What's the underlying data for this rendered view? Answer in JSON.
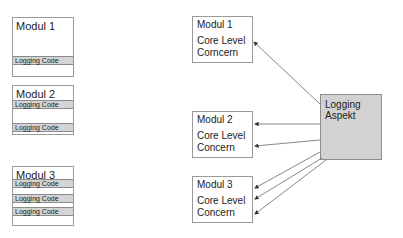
{
  "left_modules": [
    {
      "title": "Modul 1",
      "bars": [
        "Logging Code"
      ]
    },
    {
      "title": "Modul 2",
      "bars": [
        "Logging Code",
        "Logging Code"
      ]
    },
    {
      "title": "Modul 3",
      "bars": [
        "Logging Code",
        "Logging Code",
        "Logging Code"
      ]
    }
  ],
  "right_modules": [
    {
      "title": "Modul 1",
      "line1": "Core Level",
      "line2": "Corncern"
    },
    {
      "title": "Modul 2",
      "line1": "Core Level",
      "line2": "Concern"
    },
    {
      "title": "Modul 3",
      "line1": "Core Level",
      "line2": "Concern"
    }
  ],
  "aspect": {
    "line1": "Logging",
    "line2": "Aspekt",
    "color": "#d2d2d2"
  }
}
